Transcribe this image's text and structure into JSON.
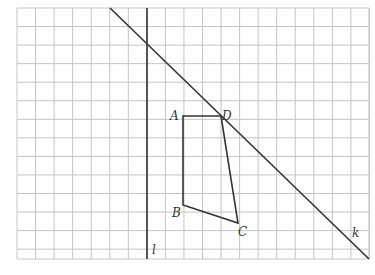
{
  "grid": {
    "x0": 17,
    "y0": 8,
    "cols": 19,
    "rows": 13.5,
    "cell": 18.55,
    "color": "#c4c4c4"
  },
  "lines": {
    "k": {
      "label": "k",
      "x1": 110,
      "y1": 8,
      "x2": 369,
      "y2": 259
    },
    "l": {
      "label": "l",
      "x1": 147,
      "y1": 8,
      "x2": 147,
      "y2": 259
    }
  },
  "quadrilateral": {
    "points": {
      "A": {
        "label": "A",
        "x": 183,
        "y": 116
      },
      "B": {
        "label": "B",
        "x": 183,
        "y": 205
      },
      "C": {
        "label": "C",
        "x": 238,
        "y": 223
      },
      "D": {
        "label": "D",
        "x": 221,
        "y": 116
      }
    }
  },
  "labels": {
    "A": "A",
    "B": "B",
    "C": "C",
    "D": "D",
    "k": "k",
    "l": "l"
  }
}
